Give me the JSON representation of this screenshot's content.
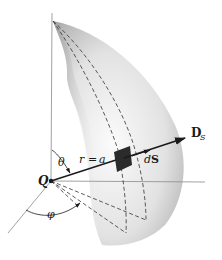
{
  "figure": {
    "type": "spherical surface element diagram",
    "labels": {
      "charge": "Q",
      "theta": "θ",
      "phi": "φ",
      "radius_r": "r",
      "radius_eq": "=",
      "radius_a": "a",
      "dS_d": "d",
      "dS_S": "S",
      "D_main": "D",
      "D_sub": "S"
    },
    "colors": {
      "axis": "#8a8a8a",
      "vector": "#1a1a1a",
      "patch": "#2b2b2b",
      "surface_light": "#f4f4f4",
      "surface_dark": "#9a9a9a",
      "dashed": "#333333"
    }
  }
}
